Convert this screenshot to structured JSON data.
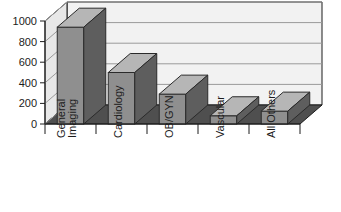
{
  "chart_data": {
    "type": "bar",
    "title": "",
    "subtitle": "",
    "xlabel": "",
    "ylabel": "",
    "ylim": [
      0,
      1000
    ],
    "yticks": [
      0,
      200,
      400,
      600,
      800,
      1000
    ],
    "ytick_labels": [
      "0",
      "200",
      "400",
      "600",
      "800",
      "1000"
    ],
    "grid": true,
    "grid_axis": "y",
    "legend": false,
    "legend_position": "none",
    "style": "3d-column",
    "categories": [
      "General Imaging",
      "Cardiology",
      "OB/GYN",
      "Vascular",
      "All Others"
    ],
    "category_lines": [
      [
        "General",
        "Imaging"
      ],
      [
        "Cardiology"
      ],
      [
        "OB/GYN"
      ],
      [
        "Vascular"
      ],
      [
        "All Others"
      ]
    ],
    "values": [
      940,
      500,
      290,
      80,
      125
    ],
    "series": [
      {
        "name": "Value",
        "values": [
          940,
          500,
          290,
          80,
          125
        ]
      }
    ],
    "tick_label_rotation": -90,
    "colors": {
      "bar_front": "#8f8f8f",
      "bar_top": "#b6b6b6",
      "bar_side": "#5e5e5e",
      "plot_back_wall": "#f2f2f2",
      "plot_left_wall": "#e8e8e8",
      "floor": "#4f4f4f",
      "gridline": "#9a9a9a",
      "axis": "#1c1c1c",
      "text": "#1c1c1c",
      "background": "#ffffff"
    }
  }
}
